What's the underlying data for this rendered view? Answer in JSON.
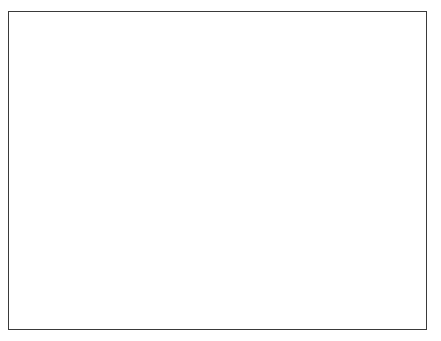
{
  "figure": {
    "title": "",
    "caption": "",
    "background_color": "#ffffff",
    "ink_color": "#000000",
    "frame": {
      "color": "#3a3a3a",
      "line_width": 1,
      "x": 8,
      "y": 11,
      "width": 419,
      "height": 319
    },
    "canvas": {
      "width": 441,
      "height": 341
    }
  },
  "chart_data": {
    "type": "scatter",
    "title": "",
    "subtitle": "",
    "xlabel": "",
    "ylabel": "",
    "xlim": [
      8,
      427
    ],
    "ylim": [
      11,
      330
    ],
    "grid": false,
    "legend": null,
    "axis_ticks": {
      "x": [],
      "y": []
    },
    "tick_labels": {
      "x": [],
      "y": []
    },
    "annotations": [],
    "marker": {
      "color": "#000000",
      "shape": "irregular-speckle",
      "min_size": 1,
      "max_size": 4
    },
    "point_count_estimate": 4200,
    "clusters": [
      {
        "name": "cluster-upper-left-small",
        "cx": 82,
        "cy": 105,
        "core_r": 3,
        "halo_r": 26,
        "points": 150,
        "arms": 7,
        "density": 0.55
      },
      {
        "name": "cluster-upper-left-main",
        "cx": 111,
        "cy": 96,
        "core_r": 8,
        "halo_r": 40,
        "points": 420,
        "arms": 9,
        "density": 0.85
      },
      {
        "name": "cluster-top-satellite",
        "cx": 211,
        "cy": 60,
        "core_r": 4.5,
        "halo_r": 32,
        "points": 260,
        "arms": 8,
        "density": 0.7
      },
      {
        "name": "cluster-center-large",
        "cx": 186,
        "cy": 116,
        "core_r": 13,
        "halo_r": 58,
        "points": 760,
        "arms": 11,
        "density": 1.0
      },
      {
        "name": "cluster-right-upper",
        "cx": 272,
        "cy": 145,
        "core_r": 5.5,
        "halo_r": 34,
        "points": 300,
        "arms": 8,
        "density": 0.72
      },
      {
        "name": "cluster-left-middle",
        "cx": 168,
        "cy": 195,
        "core_r": 5,
        "halo_r": 32,
        "points": 270,
        "arms": 8,
        "density": 0.68
      },
      {
        "name": "cluster-lower-large",
        "cx": 250,
        "cy": 216,
        "core_r": 13,
        "halo_r": 60,
        "points": 800,
        "arms": 11,
        "density": 1.0
      },
      {
        "name": "cluster-lower-right-mid",
        "cx": 327,
        "cy": 242,
        "core_r": 6.5,
        "halo_r": 36,
        "points": 330,
        "arms": 9,
        "density": 0.78
      },
      {
        "name": "cluster-far-right-small",
        "cx": 358,
        "cy": 240,
        "core_r": 3,
        "halo_r": 22,
        "points": 130,
        "arms": 7,
        "density": 0.5
      },
      {
        "name": "cluster-bottom-small",
        "cx": 228,
        "cy": 283,
        "core_r": 5,
        "halo_r": 30,
        "points": 240,
        "arms": 8,
        "density": 0.65
      }
    ],
    "bridges": [
      {
        "from": "cluster-upper-left-main",
        "to": "cluster-center-large",
        "points": 90
      },
      {
        "from": "cluster-center-large",
        "to": "cluster-top-satellite",
        "points": 70
      },
      {
        "from": "cluster-center-large",
        "to": "cluster-left-middle",
        "points": 60
      },
      {
        "from": "cluster-center-large",
        "to": "cluster-right-upper",
        "points": 55
      },
      {
        "from": "cluster-right-upper",
        "to": "cluster-lower-large",
        "points": 70
      },
      {
        "from": "cluster-lower-large",
        "to": "cluster-lower-right-mid",
        "points": 80
      },
      {
        "from": "cluster-lower-large",
        "to": "cluster-bottom-small",
        "points": 60
      },
      {
        "from": "cluster-lower-right-mid",
        "to": "cluster-far-right-small",
        "points": 45
      },
      {
        "from": "cluster-upper-left-small",
        "to": "cluster-upper-left-main",
        "points": 40
      }
    ]
  }
}
